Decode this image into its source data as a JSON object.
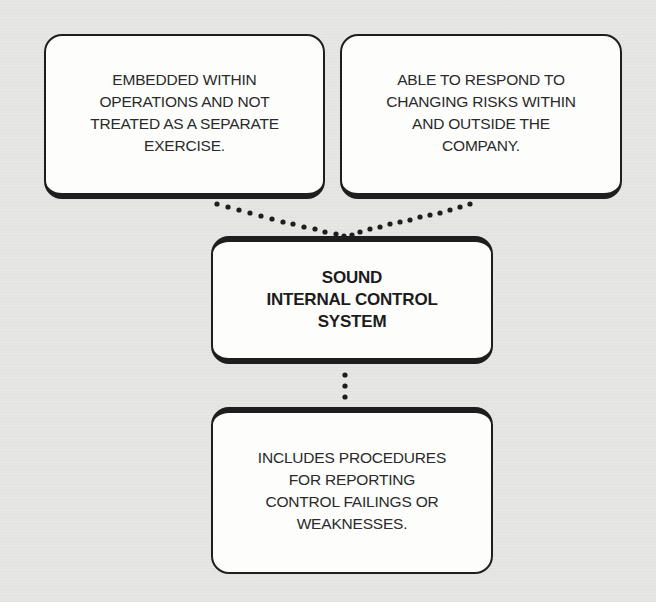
{
  "diagram": {
    "type": "hierarchy",
    "colors": {
      "background": "#e6e6e4",
      "box_fill": "#fdfdfc",
      "box_border": "#1e1e1e",
      "text": "#2a2a2a",
      "connector": "#1e1e1e"
    },
    "top_left_box": {
      "text": "EMBEDDED WITHIN\nOPERATIONS AND NOT\nTREATED AS A SEPARATE\nEXERCISE."
    },
    "top_right_box": {
      "text": "ABLE TO RESPOND TO\nCHANGING RISKS WITHIN\nAND OUTSIDE THE\nCOMPANY."
    },
    "center_box": {
      "text": "SOUND\nINTERNAL CONTROL\nSYSTEM"
    },
    "bottom_box": {
      "text": "INCLUDES PROCEDURES\nFOR REPORTING\nCONTROL FAILINGS OR\nWEAKNESSES."
    },
    "connectors": [
      {
        "from": "top_left_box",
        "to": "center_box",
        "style": "dotted"
      },
      {
        "from": "top_right_box",
        "to": "center_box",
        "style": "dotted"
      },
      {
        "from": "center_box",
        "to": "bottom_box",
        "style": "dotted"
      }
    ]
  }
}
